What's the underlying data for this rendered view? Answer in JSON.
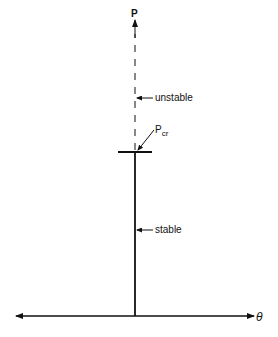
{
  "diagram": {
    "type": "bifurcation-diagram",
    "vertical_axis_label": "P",
    "horizontal_axis_label": "θ",
    "critical_load_label": {
      "main": "P",
      "subscript": "cr"
    },
    "annotations": {
      "unstable": "unstable",
      "stable": "stable"
    },
    "colors": {
      "line": "#111111",
      "background": "#ffffff"
    }
  }
}
